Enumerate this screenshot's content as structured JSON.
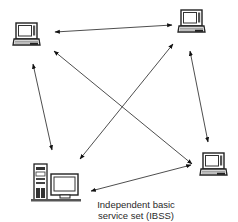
{
  "diagram": {
    "type": "network-topology",
    "caption": {
      "line1": "Independent basic",
      "line2": "service set (IBSS)"
    },
    "nodes": [
      {
        "id": "laptop-top-left",
        "kind": "laptop",
        "x": 13,
        "y": 22
      },
      {
        "id": "laptop-top-right",
        "kind": "laptop",
        "x": 178,
        "y": 9
      },
      {
        "id": "laptop-bottom-right",
        "kind": "laptop",
        "x": 200,
        "y": 150
      },
      {
        "id": "desktop-bottom-left",
        "kind": "desktop",
        "x": 31,
        "y": 164
      }
    ],
    "links": [
      {
        "from": "laptop-top-left",
        "to": "laptop-top-right",
        "bidirectional": true
      },
      {
        "from": "laptop-top-left",
        "to": "laptop-bottom-right",
        "bidirectional": true
      },
      {
        "from": "laptop-top-right",
        "to": "desktop-bottom-left",
        "bidirectional": true
      },
      {
        "from": "laptop-top-left",
        "to": "desktop-bottom-left",
        "bidirectional": true
      },
      {
        "from": "laptop-top-right",
        "to": "laptop-bottom-right",
        "bidirectional": true
      },
      {
        "from": "desktop-bottom-left",
        "to": "laptop-bottom-right",
        "bidirectional": true
      }
    ],
    "colors": {
      "line": "#3a3a3a",
      "device": "#2b2b2b",
      "background": "#ffffff"
    }
  }
}
